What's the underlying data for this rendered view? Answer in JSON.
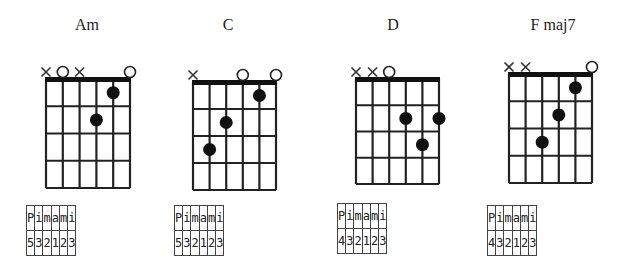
{
  "chords": [
    {
      "name": "Am",
      "title_x": 87,
      "grid": {
        "x": 46,
        "y": 79,
        "w": 84,
        "h": 109
      },
      "strings": [
        "x",
        "o",
        "x",
        null,
        null,
        "o"
      ],
      "dots": [
        {
          "string": 5,
          "fret": 1
        },
        {
          "string": 4,
          "fret": 2
        }
      ],
      "table": {
        "x": 26,
        "y": 205,
        "fingers": [
          "P",
          "i",
          "m",
          "a",
          "m",
          "i"
        ],
        "numbers": [
          "5",
          "3",
          "2",
          "1",
          "2",
          "3"
        ]
      }
    },
    {
      "name": "C",
      "title_x": 228,
      "grid": {
        "x": 193,
        "y": 82,
        "w": 83,
        "h": 108
      },
      "strings": [
        "x",
        null,
        null,
        "o",
        null,
        "o"
      ],
      "dots": [
        {
          "string": 5,
          "fret": 1
        },
        {
          "string": 3,
          "fret": 2
        },
        {
          "string": 2,
          "fret": 3
        }
      ],
      "table": {
        "x": 174,
        "y": 205,
        "fingers": [
          "P",
          "i",
          "m",
          "a",
          "m",
          "i"
        ],
        "numbers": [
          "5",
          "3",
          "2",
          "1",
          "2",
          "3"
        ]
      }
    },
    {
      "name": "D",
      "title_x": 393,
      "grid": {
        "x": 356,
        "y": 79,
        "w": 83,
        "h": 105
      },
      "strings": [
        "x",
        "x",
        "o",
        null,
        null,
        null
      ],
      "dots": [
        {
          "string": 4,
          "fret": 2
        },
        {
          "string": 6,
          "fret": 2
        },
        {
          "string": 5,
          "fret": 3
        }
      ],
      "table": {
        "x": 337,
        "y": 203,
        "fingers": [
          "P",
          "i",
          "m",
          "a",
          "m",
          "i"
        ],
        "numbers": [
          "4",
          "3",
          "2",
          "1",
          "2",
          "3"
        ]
      }
    },
    {
      "name": "F maj7",
      "title_x": 553,
      "grid": {
        "x": 509,
        "y": 74,
        "w": 83,
        "h": 109
      },
      "strings": [
        "x",
        "x",
        null,
        null,
        null,
        "o"
      ],
      "dots": [
        {
          "string": 5,
          "fret": 1
        },
        {
          "string": 4,
          "fret": 2
        },
        {
          "string": 3,
          "fret": 3
        }
      ],
      "table": {
        "x": 487,
        "y": 205,
        "fingers": [
          "P",
          "i",
          "m",
          "a",
          "m",
          "i"
        ],
        "numbers": [
          "4",
          "3",
          "2",
          "1",
          "2",
          "3"
        ]
      }
    }
  ]
}
